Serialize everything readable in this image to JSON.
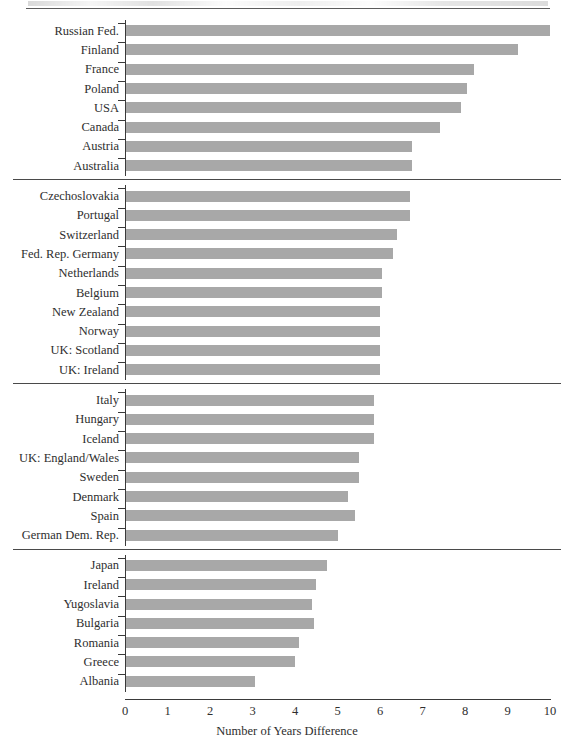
{
  "page": {
    "artifact_note": "scanned-page-header-remnant"
  },
  "chart_data": {
    "type": "bar",
    "orientation": "horizontal",
    "title": "",
    "xlabel": "Number of Years Difference",
    "ylabel": "",
    "xlim": [
      0,
      10
    ],
    "xticks": [
      "0",
      "1",
      "2",
      "3",
      "4",
      "5",
      "6",
      "7",
      "8",
      "9",
      "10"
    ],
    "grid": false,
    "legend": null,
    "bar_color": "#a8a8a8",
    "axis_color": "#3a3a3a",
    "groups": [
      {
        "name": "group-1",
        "categories": [
          "Russian Fed.",
          "Finland",
          "France",
          "Poland",
          "USA",
          "Canada",
          "Austria",
          "Australia"
        ],
        "values": [
          10.0,
          9.25,
          8.2,
          8.05,
          7.9,
          7.4,
          6.75,
          6.75
        ]
      },
      {
        "name": "group-2",
        "categories": [
          "Czechoslovakia",
          "Portugal",
          "Switzerland",
          "Fed. Rep. Germany",
          "Netherlands",
          "Belgium",
          "New Zealand",
          "Norway",
          "UK: Scotland",
          "UK: Ireland"
        ],
        "values": [
          6.7,
          6.7,
          6.4,
          6.3,
          6.05,
          6.05,
          6.0,
          6.0,
          6.0,
          6.0
        ]
      },
      {
        "name": "group-3",
        "categories": [
          "Italy",
          "Hungary",
          "Iceland",
          "UK: England/Wales",
          "Sweden",
          "Denmark",
          "Spain",
          "German Dem. Rep."
        ],
        "values": [
          5.85,
          5.85,
          5.85,
          5.5,
          5.5,
          5.25,
          5.4,
          5.0
        ]
      },
      {
        "name": "group-4",
        "categories": [
          "Japan",
          "Ireland",
          "Yugoslavia",
          "Bulgaria",
          "Romania",
          "Greece",
          "Albania"
        ],
        "values": [
          4.75,
          4.5,
          4.4,
          4.45,
          4.1,
          4.0,
          3.05
        ]
      }
    ]
  }
}
